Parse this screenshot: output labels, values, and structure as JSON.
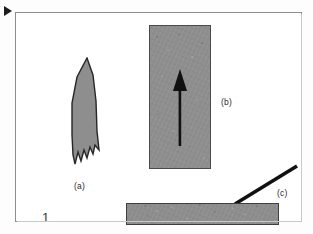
{
  "figure": {
    "number": "1",
    "marker_icon": "play-triangle-icon",
    "background_color": "#fdfdfd",
    "frame_color": "#8d8d8d",
    "fill_gray": "#8e8e8e",
    "ink_black": "#1d1d1d",
    "labels": [
      {
        "id": "a",
        "text": "(a)"
      },
      {
        "id": "b",
        "text": "(b)"
      },
      {
        "id": "c",
        "text": "(c)"
      }
    ],
    "objects": [
      {
        "id": "a",
        "name": "pointed-jagged-blade",
        "description": "Gray elongated shape with a sharp pointed top and a serrated sawtooth bottom edge",
        "fill": "#8e8e8e",
        "outline": "#262626"
      },
      {
        "id": "b",
        "name": "textured-rectangle-with-arrow",
        "description": "Tall speckled gray rectangle containing a black arrow pointing upward",
        "fill": "#8e8e8e",
        "outline": "#4a4a4a",
        "arrow_direction": "up",
        "arrow_color": "#111111"
      },
      {
        "id": "c",
        "name": "diagonal-line",
        "description": "Thick black line running from lower-left up to the upper-right",
        "color": "#111111"
      },
      {
        "id": "bar",
        "name": "horizontal-bar",
        "description": "Wide speckled gray horizontal bar at the bottom of the frame",
        "fill": "#8d8d8d",
        "outline": "#3f3f3f"
      }
    ]
  }
}
